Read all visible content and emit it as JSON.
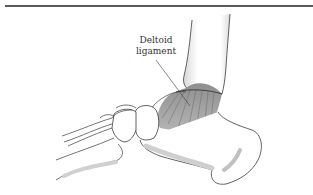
{
  "figure": {
    "label": {
      "line1": "Deltoid",
      "line2": "ligament"
    },
    "colors": {
      "outline": "#3a3a3a",
      "rule": "#5a5a5a",
      "ligament_fill": "#9a9a9a",
      "shadow": "#c8c8c8",
      "background": "#ffffff"
    }
  }
}
